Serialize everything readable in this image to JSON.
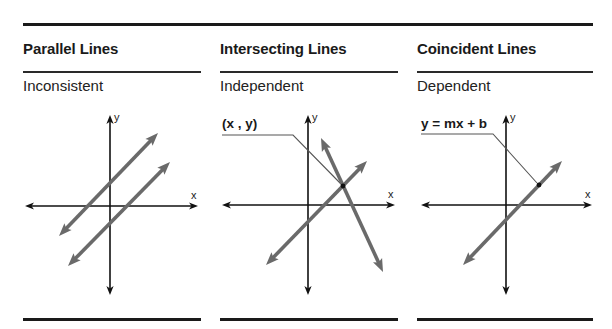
{
  "columns": [
    {
      "title": "Parallel Lines",
      "subtitle": "Inconsistent",
      "left": 23,
      "width": 178,
      "axes": {
        "cx": 110,
        "cy": 206,
        "x_left": 25,
        "x_right": 198,
        "y_top": 115,
        "y_bottom": 295,
        "x_label": "x",
        "y_label": "y"
      },
      "lines": [
        {
          "x1": 59,
          "y1": 236,
          "x2": 158,
          "y2": 133
        },
        {
          "x1": 68,
          "y1": 266,
          "x2": 170,
          "y2": 162
        }
      ],
      "annotation": null
    },
    {
      "title": "Intersecting Lines",
      "subtitle": "Independent",
      "left": 220,
      "width": 178,
      "axes": {
        "cx": 308,
        "cy": 205,
        "x_left": 222,
        "x_right": 395,
        "y_top": 115,
        "y_bottom": 295,
        "x_label": "x",
        "y_label": "y"
      },
      "lines": [
        {
          "x1": 266,
          "y1": 265,
          "x2": 367,
          "y2": 161
        },
        {
          "x1": 321,
          "y1": 138,
          "x2": 383,
          "y2": 272
        }
      ],
      "annotation": {
        "label": "(x , y)",
        "label_x": 222,
        "label_y": 128,
        "lx1": 222,
        "ly": 135,
        "lx2": 293,
        "px": 343,
        "py": 186
      }
    },
    {
      "title": "Coincident Lines",
      "subtitle": "Dependent",
      "left": 417,
      "width": 176,
      "axes": {
        "cx": 506,
        "cy": 205,
        "x_left": 421,
        "x_right": 592,
        "y_top": 115,
        "y_bottom": 295,
        "x_label": "x",
        "y_label": "y"
      },
      "lines": [
        {
          "x1": 463,
          "y1": 265,
          "x2": 562,
          "y2": 161
        }
      ],
      "annotation": {
        "label": "y = mx + b",
        "label_x": 421,
        "label_y": 128,
        "lx1": 421,
        "ly": 134,
        "lx2": 493,
        "px": 539,
        "py": 185
      }
    }
  ],
  "colors": {
    "axis": "#111111",
    "line": "#6a6a6a",
    "leader": "#555555",
    "rule": "#1a1a1a"
  }
}
